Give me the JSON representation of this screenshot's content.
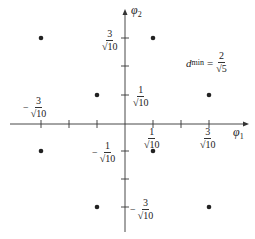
{
  "diagram": {
    "axes": {
      "x_label": "φ",
      "x_label_sub": "1",
      "y_label": "φ",
      "y_label_sub": "2"
    },
    "tick_labels": {
      "x_pos1": {
        "minus": "",
        "num": "1",
        "den": "√10"
      },
      "x_pos3": {
        "minus": "",
        "num": "3",
        "den": "√10"
      },
      "x_neg3": {
        "minus": "−",
        "num": "3",
        "den": "√10"
      },
      "y_pos3": {
        "minus": "",
        "num": "3",
        "den": "√10"
      },
      "y_pos1": {
        "minus": "",
        "num": "1",
        "den": "√10"
      },
      "y_neg1": {
        "minus": "−",
        "num": "1",
        "den": "√10"
      },
      "y_neg3": {
        "minus": "−",
        "num": "3",
        "den": "√10"
      }
    },
    "annotation": {
      "d": "d",
      "sub": "min",
      "eq": "=",
      "num": "2",
      "den": "√5"
    },
    "points": [
      {
        "x": -3,
        "y": 3
      },
      {
        "x": -1,
        "y": 3
      },
      {
        "x": 1,
        "y": 3
      },
      {
        "x": 3,
        "y": 3
      },
      {
        "x": -3,
        "y": 1
      },
      {
        "x": -1,
        "y": 1
      },
      {
        "x": 1,
        "y": 1
      },
      {
        "x": 3,
        "y": 1
      },
      {
        "x": -3,
        "y": -1
      },
      {
        "x": -1,
        "y": -1
      },
      {
        "x": 1,
        "y": -1
      },
      {
        "x": 3,
        "y": -1
      },
      {
        "x": -3,
        "y": -3
      },
      {
        "x": -1,
        "y": -3
      },
      {
        "x": 1,
        "y": -3
      },
      {
        "x": 3,
        "y": -3
      }
    ],
    "visible_points": [
      {
        "x": -3,
        "y": 3
      },
      {
        "x": 1,
        "y": 3
      },
      {
        "x": -1,
        "y": 1
      },
      {
        "x": 3,
        "y": 1
      },
      {
        "x": -3,
        "y": -1
      },
      {
        "x": 1,
        "y": -1
      },
      {
        "x": -1,
        "y": -3
      },
      {
        "x": 3,
        "y": -3
      }
    ]
  }
}
